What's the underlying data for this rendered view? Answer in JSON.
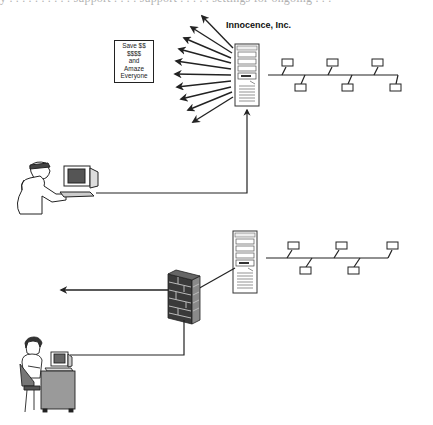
{
  "diagram": {
    "clipped_caption": "y . . . . . . . . . . support . . . . support . . . . . settings for ongoing . . .",
    "company_label": "Innocence, Inc.",
    "callout_lines": [
      "Save $$",
      "$$$$",
      "and",
      "Amaze",
      "Everyone"
    ],
    "sections": [
      {
        "name": "top-scenario",
        "nodes": [
          "spam-broadcast-arrows",
          "company-server",
          "office-lan-bus",
          "attacker-workstation"
        ],
        "arrow_count": 10,
        "lan_workstations": 6
      },
      {
        "name": "bottom-scenario",
        "nodes": [
          "server",
          "lan-bus",
          "firewall",
          "outbound-arrow",
          "user-workstation"
        ],
        "lan_workstations": 5
      }
    ],
    "colors": {
      "line": "#222222",
      "firewall_brick": "#3a3a3a",
      "firewall_mortar": "#bbbbbb",
      "desk": "#9a9a9a",
      "screen": "#555555"
    }
  }
}
